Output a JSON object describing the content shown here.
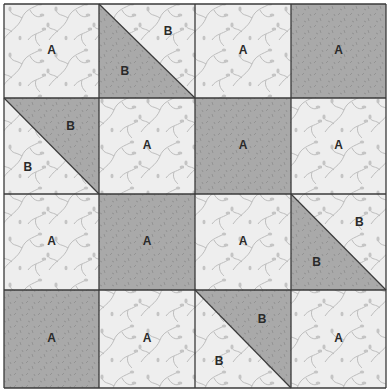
{
  "colors": {
    "light": "#eeeeee",
    "dark": "#a9a9a9",
    "vine": "#bdbdbd",
    "darkspeck": "#8f8f8f",
    "line": "#3a3a3a"
  },
  "grid": {
    "xs": [
      4,
      99,
      195,
      291,
      386
    ],
    "ys": [
      4,
      98,
      194,
      290,
      388
    ]
  },
  "cells": [
    {
      "r": 0,
      "c": 0,
      "type": "A",
      "fabric": "light",
      "label": "A"
    },
    {
      "r": 0,
      "c": 1,
      "type": "HST",
      "diag": "tl-br",
      "lower": "dark",
      "upper": "light",
      "labels": [
        "B",
        "B"
      ],
      "lpos": [
        [
          0.72,
          0.3
        ],
        [
          0.27,
          0.72
        ]
      ]
    },
    {
      "r": 0,
      "c": 2,
      "type": "A",
      "fabric": "light",
      "label": "A"
    },
    {
      "r": 0,
      "c": 3,
      "type": "A",
      "fabric": "dark",
      "label": "A"
    },
    {
      "r": 1,
      "c": 0,
      "type": "HST",
      "diag": "tl-br",
      "lower": "light",
      "upper": "dark",
      "labels": [
        "B",
        "B"
      ],
      "lpos": [
        [
          0.7,
          0.3
        ],
        [
          0.25,
          0.73
        ]
      ]
    },
    {
      "r": 1,
      "c": 1,
      "type": "A",
      "fabric": "light",
      "label": "A"
    },
    {
      "r": 1,
      "c": 2,
      "type": "A",
      "fabric": "dark",
      "label": "A"
    },
    {
      "r": 1,
      "c": 3,
      "type": "A",
      "fabric": "light",
      "label": "A"
    },
    {
      "r": 2,
      "c": 0,
      "type": "A",
      "fabric": "light",
      "label": "A"
    },
    {
      "r": 2,
      "c": 1,
      "type": "A",
      "fabric": "dark",
      "label": "A"
    },
    {
      "r": 2,
      "c": 2,
      "type": "A",
      "fabric": "light",
      "label": "A"
    },
    {
      "r": 2,
      "c": 3,
      "type": "HST",
      "diag": "tl-br",
      "lower": "dark",
      "upper": "light",
      "labels": [
        "B",
        "B"
      ],
      "lpos": [
        [
          0.72,
          0.3
        ],
        [
          0.27,
          0.72
        ]
      ]
    },
    {
      "r": 3,
      "c": 0,
      "type": "A",
      "fabric": "dark",
      "label": "A"
    },
    {
      "r": 3,
      "c": 1,
      "type": "A",
      "fabric": "light",
      "label": "A"
    },
    {
      "r": 3,
      "c": 2,
      "type": "HST",
      "diag": "tl-br",
      "lower": "light",
      "upper": "dark",
      "labels": [
        "B",
        "B"
      ],
      "lpos": [
        [
          0.7,
          0.3
        ],
        [
          0.25,
          0.73
        ]
      ]
    },
    {
      "r": 3,
      "c": 3,
      "type": "A",
      "fabric": "light",
      "label": "A"
    }
  ]
}
